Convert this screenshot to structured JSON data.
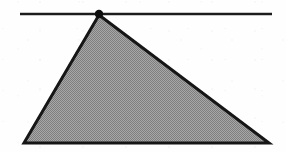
{
  "figure": {
    "canvas": {
      "width": 286,
      "height": 152
    },
    "background_color": "#fefefe",
    "ink_color": "#1a1a1a",
    "fill_color": "#9a9a9a",
    "fill_style": "halftone-dither-gray",
    "stroke_width": 3,
    "elements": [
      {
        "name": "horizontal-line",
        "type": "line",
        "x1": 20,
        "y1": 14,
        "x2": 272,
        "y2": 14,
        "stroke": "#1f1f1f",
        "stroke_width": 2.6
      },
      {
        "name": "shaded-triangle",
        "type": "polygon",
        "points": "99,15 269,143 24,143",
        "vertices": [
          {
            "label": "apex",
            "x": 99,
            "y": 15
          },
          {
            "label": "bottom-right",
            "x": 269,
            "y": 143
          },
          {
            "label": "bottom-left",
            "x": 24,
            "y": 143
          }
        ],
        "fill": "#9a9a9a",
        "stroke": "#141414",
        "stroke_width": 3
      },
      {
        "name": "apex-vertex-dot",
        "type": "circle",
        "cx": 99,
        "cy": 14,
        "r": 4.2,
        "fill": "#111111"
      }
    ]
  }
}
